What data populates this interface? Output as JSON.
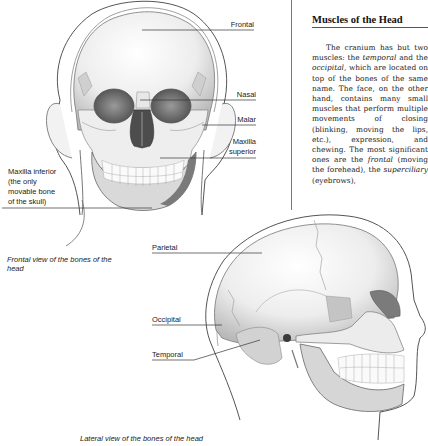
{
  "article": {
    "heading": "Muscles of the Head",
    "paragraph": [
      {
        "t": "The cranium has but two muscles: the ",
        "i": false
      },
      {
        "t": "temporal",
        "i": true
      },
      {
        "t": " and the ",
        "i": false
      },
      {
        "t": "occipital",
        "i": true
      },
      {
        "t": ", which are located on top of the bones of the same name. The face, on the other hand, contains many small muscles that perform multiple movements of closing (blinking, moving the lips, etc.), expression, and chewing. The most significant ones are the ",
        "i": false
      },
      {
        "t": "frontal",
        "i": true
      },
      {
        "t": " (moving the forehead), the ",
        "i": false
      },
      {
        "t": "superciliary",
        "i": true
      },
      {
        "t": " (eyebrows),",
        "i": false
      }
    ]
  },
  "frontal_view": {
    "caption": "Frontal view of the bones of the head",
    "labels": {
      "frontal": "Frontal",
      "nasal": "Nasal",
      "malar": "Malar",
      "maxilla_superior_1": "Maxilla",
      "maxilla_superior_2": "superior",
      "maxilla_inferior_1": "Maxilla inferior",
      "maxilla_inferior_2": "(the only",
      "maxilla_inferior_3": "movable bone",
      "maxilla_inferior_4": "of the skull)"
    }
  },
  "lateral_view": {
    "caption": "Lateral view of the bones of the head",
    "labels": {
      "parietal": "Parietal",
      "occipital": "Occipital",
      "temporal": "Temporal"
    }
  }
}
